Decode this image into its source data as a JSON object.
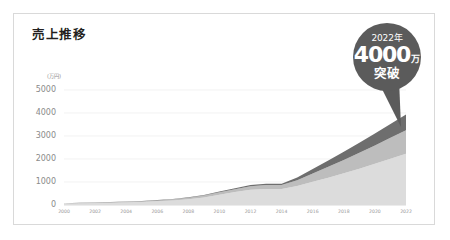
{
  "card": {
    "title": "売上推移"
  },
  "callout": {
    "year": "2022年",
    "value": "4000",
    "unit_man": "万",
    "breakthrough": "突破",
    "bg_color": "#5b5b5b",
    "text_color": "#ffffff"
  },
  "chart_data": {
    "type": "area",
    "title": "売上推移",
    "xlabel": "",
    "ylabel": "(万円)",
    "unit": "(万円)",
    "grid": true,
    "legend_position": "none",
    "stacked": true,
    "ylim": [
      0,
      5000
    ],
    "yticks": [
      "0",
      "1000",
      "2000",
      "3000",
      "4000",
      "5000"
    ],
    "ytick_values": [
      0,
      1000,
      2000,
      3000,
      4000,
      5000
    ],
    "x": [
      2000,
      2001,
      2002,
      2003,
      2004,
      2005,
      2006,
      2007,
      2008,
      2009,
      2010,
      2011,
      2012,
      2013,
      2014,
      2015,
      2016,
      2017,
      2018,
      2019,
      2020,
      2021,
      2022
    ],
    "xticks": [
      "2000",
      "2002",
      "2004",
      "2006",
      "2008",
      "2010",
      "2012",
      "2014",
      "2016",
      "2018",
      "2020",
      "2022"
    ],
    "xtick_values": [
      2000,
      2002,
      2004,
      2006,
      2008,
      2010,
      2012,
      2014,
      2016,
      2018,
      2020,
      2022
    ],
    "xlim": [
      2000,
      2022
    ],
    "series": [
      {
        "name": "series-1",
        "color": "#dcdcdc",
        "values": [
          60,
          70,
          80,
          95,
          110,
          130,
          160,
          200,
          250,
          330,
          450,
          560,
          660,
          700,
          700,
          830,
          1010,
          1190,
          1380,
          1580,
          1790,
          2010,
          2230
        ]
      },
      {
        "name": "series-2",
        "color": "#bdbdbd",
        "values": [
          15,
          18,
          20,
          24,
          28,
          33,
          40,
          50,
          62,
          80,
          105,
          130,
          155,
          165,
          165,
          250,
          360,
          470,
          580,
          690,
          800,
          910,
          1020
        ]
      },
      {
        "name": "series-3",
        "color": "#6e6e6e",
        "values": [
          5,
          6,
          7,
          8,
          9,
          11,
          13,
          16,
          20,
          26,
          34,
          42,
          50,
          54,
          54,
          120,
          200,
          280,
          360,
          440,
          520,
          600,
          680
        ]
      }
    ],
    "totals": [
      80,
      94,
      107,
      127,
      147,
      174,
      213,
      266,
      332,
      436,
      589,
      732,
      865,
      919,
      919,
      1200,
      1570,
      1940,
      2320,
      2710,
      3110,
      3520,
      3930
    ]
  }
}
